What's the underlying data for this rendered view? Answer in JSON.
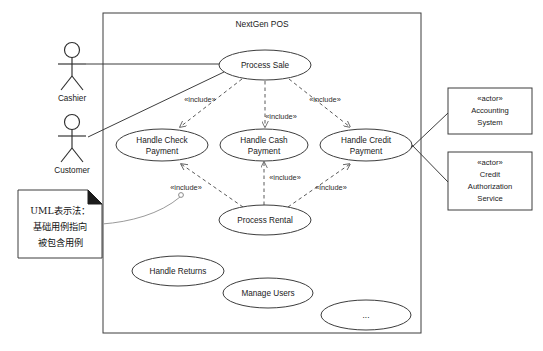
{
  "diagram": {
    "kind": "uml-use-case-diagram",
    "system_boundary": {
      "title": "NextGen POS",
      "x": 103,
      "y": 13,
      "width": 318,
      "height": 320
    },
    "actors": [
      {
        "id": "cashier",
        "label": "Cashier",
        "x": 72,
        "y": 48
      },
      {
        "id": "customer",
        "label": "Customer",
        "x": 72,
        "y": 120
      }
    ],
    "external_actors": [
      {
        "id": "accounting-system",
        "stereotype": "«actor»",
        "name_lines": [
          "Accounting",
          "System"
        ],
        "x": 448,
        "y": 88,
        "width": 84,
        "height": 46
      },
      {
        "id": "credit-authorization-service",
        "stereotype": "«actor»",
        "name_lines": [
          "Credit",
          "Authorization",
          "Service"
        ],
        "x": 448,
        "y": 152,
        "width": 84,
        "height": 58
      }
    ],
    "use_cases": [
      {
        "id": "process-sale",
        "lines": [
          "Process Sale"
        ],
        "cx": 265,
        "cy": 65,
        "rx": 46,
        "ry": 15
      },
      {
        "id": "handle-check-payment",
        "lines": [
          "Handle Check",
          "Payment"
        ],
        "cx": 162,
        "cy": 145,
        "rx": 46,
        "ry": 16
      },
      {
        "id": "handle-cash-payment",
        "lines": [
          "Handle Cash",
          "Payment"
        ],
        "cx": 264,
        "cy": 145,
        "rx": 44,
        "ry": 16
      },
      {
        "id": "handle-credit-payment",
        "lines": [
          "Handle Credit",
          "Payment"
        ],
        "cx": 366,
        "cy": 145,
        "rx": 46,
        "ry": 16
      },
      {
        "id": "process-rental",
        "lines": [
          "Process Rental"
        ],
        "cx": 265,
        "cy": 220,
        "rx": 46,
        "ry": 15
      },
      {
        "id": "handle-returns",
        "lines": [
          "Handle Returns"
        ],
        "cx": 178,
        "cy": 271,
        "rx": 46,
        "ry": 15
      },
      {
        "id": "manage-users",
        "lines": [
          "Manage Users"
        ],
        "cx": 268,
        "cy": 293,
        "rx": 45,
        "ry": 15
      },
      {
        "id": "ellipsis-use-case",
        "lines": [
          "..."
        ],
        "cx": 366,
        "cy": 315,
        "rx": 45,
        "ry": 15
      }
    ],
    "include_labels": [
      {
        "id": "include-sale-check",
        "text": "«include»",
        "x": 200,
        "y": 102
      },
      {
        "id": "include-sale-cash",
        "text": "«include»",
        "x": 281,
        "y": 119
      },
      {
        "id": "include-sale-credit",
        "text": "«include»",
        "x": 325,
        "y": 102
      },
      {
        "id": "include-rental-check",
        "text": "«include»",
        "x": 186,
        "y": 190
      },
      {
        "id": "include-rental-cash",
        "text": "«include»",
        "x": 285,
        "y": 180
      },
      {
        "id": "include-rental-credit",
        "text": "«include»",
        "x": 331,
        "y": 190
      }
    ],
    "note": {
      "id": "uml-notation-note",
      "lines": [
        "UML表示法：",
        "基础用例指向",
        "被包含用例"
      ],
      "x": 18,
      "y": 190,
      "width": 84,
      "height": 68
    },
    "colors": {
      "background": "#ffffff",
      "stroke": "#3d3d3d",
      "dashed_stroke": "#5a5a5a",
      "note_fold": "#1c1c1c",
      "text": "#1a1a1a"
    }
  }
}
